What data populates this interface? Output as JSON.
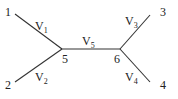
{
  "diagram": {
    "type": "unrooted-tree",
    "nodes": [
      {
        "id": "1",
        "label": "1",
        "x": 10,
        "y": 13
      },
      {
        "id": "2",
        "label": "2",
        "x": 10,
        "y": 88
      },
      {
        "id": "3",
        "label": "3",
        "x": 167,
        "y": 13
      },
      {
        "id": "4",
        "label": "4",
        "x": 167,
        "y": 88
      },
      {
        "id": "5",
        "label": "5",
        "x": 66,
        "y": 62
      },
      {
        "id": "6",
        "label": "6",
        "x": 118,
        "y": 62
      }
    ],
    "edges": [
      {
        "from": "1",
        "to": "5",
        "label": "V",
        "sub": "1"
      },
      {
        "from": "2",
        "to": "5",
        "label": "V",
        "sub": "2"
      },
      {
        "from": "5",
        "to": "6",
        "label": "V",
        "sub": "5"
      },
      {
        "from": "6",
        "to": "3",
        "label": "V",
        "sub": "3"
      },
      {
        "from": "6",
        "to": "4",
        "label": "V",
        "sub": "4"
      }
    ],
    "line_color": "#333333"
  }
}
